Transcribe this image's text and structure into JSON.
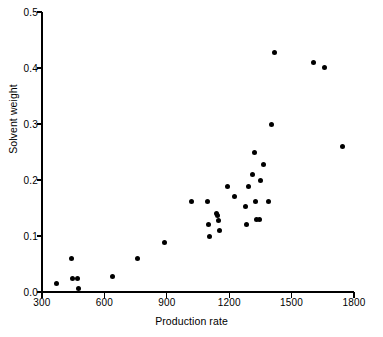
{
  "chart_data": {
    "type": "scatter",
    "title": "",
    "xlabel": "Production rate",
    "ylabel": "Solvent weight",
    "xlim": [
      300,
      1800
    ],
    "ylim": [
      0.0,
      0.5
    ],
    "xticks": [
      "300",
      "600",
      "900",
      "1200",
      "1500",
      "1800"
    ],
    "xtick_values": [
      300,
      600,
      900,
      1200,
      1500,
      1800
    ],
    "yticks": [
      "0.0",
      "0.1",
      "0.2",
      "0.3",
      "0.4",
      "0.5"
    ],
    "ytick_values": [
      0.0,
      0.1,
      0.2,
      0.3,
      0.4,
      0.5
    ],
    "grid": false,
    "legend": null,
    "marker": "filled-circle",
    "marker_color": "#000000",
    "points": [
      {
        "x": 370,
        "y": 0.016
      },
      {
        "x": 440,
        "y": 0.06
      },
      {
        "x": 445,
        "y": 0.025
      },
      {
        "x": 470,
        "y": 0.025
      },
      {
        "x": 475,
        "y": 0.006
      },
      {
        "x": 640,
        "y": 0.028
      },
      {
        "x": 760,
        "y": 0.06
      },
      {
        "x": 890,
        "y": 0.089
      },
      {
        "x": 1020,
        "y": 0.161
      },
      {
        "x": 1095,
        "y": 0.161
      },
      {
        "x": 1100,
        "y": 0.12
      },
      {
        "x": 1105,
        "y": 0.1
      },
      {
        "x": 1140,
        "y": 0.14
      },
      {
        "x": 1145,
        "y": 0.136
      },
      {
        "x": 1150,
        "y": 0.128
      },
      {
        "x": 1155,
        "y": 0.11
      },
      {
        "x": 1190,
        "y": 0.188
      },
      {
        "x": 1225,
        "y": 0.17
      },
      {
        "x": 1280,
        "y": 0.152
      },
      {
        "x": 1285,
        "y": 0.12
      },
      {
        "x": 1295,
        "y": 0.188
      },
      {
        "x": 1310,
        "y": 0.21
      },
      {
        "x": 1320,
        "y": 0.25
      },
      {
        "x": 1325,
        "y": 0.161
      },
      {
        "x": 1330,
        "y": 0.129
      },
      {
        "x": 1345,
        "y": 0.129
      },
      {
        "x": 1350,
        "y": 0.2
      },
      {
        "x": 1365,
        "y": 0.228
      },
      {
        "x": 1390,
        "y": 0.161
      },
      {
        "x": 1405,
        "y": 0.3
      },
      {
        "x": 1420,
        "y": 0.428
      },
      {
        "x": 1605,
        "y": 0.41
      },
      {
        "x": 1660,
        "y": 0.401
      },
      {
        "x": 1745,
        "y": 0.259
      }
    ]
  },
  "axes": {
    "x_axis_name": "x-axis",
    "y_axis_name": "y-axis"
  }
}
